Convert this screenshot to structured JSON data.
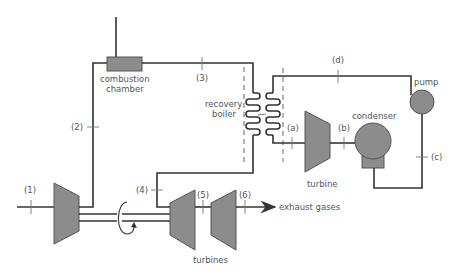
{
  "diagram": {
    "colors": {
      "line": "#333333",
      "machine_fill": "#8c8c8c",
      "label": "#555555"
    },
    "components": {
      "combustion_chamber": "combustion chamber",
      "combustion_chamber_line1": "combustion",
      "combustion_chamber_line2": "chamber",
      "recovery_boiler_line1": "recovery",
      "recovery_boiler_line2": "boiler",
      "turbines": "turbines",
      "steam_turbine": "turbine",
      "condenser": "condenser",
      "pump": "pump",
      "exhaust": "exhaust gases"
    },
    "state_points": {
      "p1": "(1)",
      "p2": "(2)",
      "p3": "(3)",
      "p4": "(4)",
      "p5": "(5)",
      "p6": "(6)",
      "pa": "(a)",
      "pb": "(b)",
      "pc": "(c)",
      "pd": "(d)"
    }
  }
}
